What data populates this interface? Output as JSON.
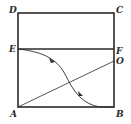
{
  "diagram": {
    "type": "geometry-figure",
    "stroke_color": "#2a2a2a",
    "background": "#ffffff",
    "points": {
      "A": {
        "label": "A",
        "x": 18,
        "y": 107
      },
      "B": {
        "label": "B",
        "x": 114,
        "y": 107
      },
      "C": {
        "label": "C",
        "x": 114,
        "y": 13
      },
      "D": {
        "label": "D",
        "x": 18,
        "y": 13
      },
      "E": {
        "label": "E",
        "x": 18,
        "y": 49
      },
      "F": {
        "label": "F",
        "x": 114,
        "y": 49
      },
      "O": {
        "label": "O",
        "x": 114,
        "y": 61
      }
    },
    "segments": [
      {
        "from": "A",
        "to": "B",
        "weight": "thick"
      },
      {
        "from": "B",
        "to": "C",
        "weight": "thick"
      },
      {
        "from": "C",
        "to": "D",
        "weight": "thick"
      },
      {
        "from": "D",
        "to": "A",
        "weight": "thick"
      },
      {
        "from": "E",
        "to": "F",
        "weight": "thick"
      },
      {
        "from": "A",
        "to": "O",
        "weight": "thin"
      }
    ],
    "curves": [
      {
        "from": "E",
        "to": "B",
        "shape": "S-curve",
        "arrows": 2,
        "direction": "E-to-B"
      }
    ]
  }
}
